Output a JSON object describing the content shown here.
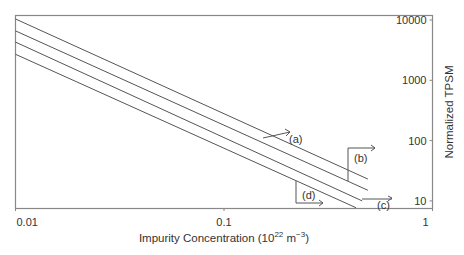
{
  "chart_data": {
    "type": "line",
    "title": "",
    "xlabel": "Impurity Concentration (10^22 m^-3)",
    "xlabel_parts": {
      "base": "Impurity Concentration (10",
      "sup1": "22",
      "mid": " m",
      "sup2": "−3",
      "end": ")"
    },
    "ylabel": "Normalized TPSM",
    "xscale": "log",
    "yscale": "log",
    "xlim": [
      0.01,
      1
    ],
    "ylim": [
      7,
      10000
    ],
    "x_ticks": [
      {
        "value": 0.01,
        "label": "0.01"
      },
      {
        "value": 0.1,
        "label": "0.1"
      },
      {
        "value": 1,
        "label": "1"
      }
    ],
    "y_ticks": [
      {
        "value": 10000,
        "label": "10000"
      },
      {
        "value": 1000,
        "label": "1000"
      },
      {
        "value": 100,
        "label": "100"
      },
      {
        "value": 10,
        "label": "10"
      }
    ],
    "y_axis_position": "right",
    "grid": false,
    "legend": "none (inline annotations)",
    "series": [
      {
        "name": "(a)",
        "x": [
          0.01,
          0.49
        ],
        "values": [
          10400,
          23
        ]
      },
      {
        "name": "(b)",
        "x": [
          0.01,
          0.49
        ],
        "values": [
          6600,
          15
        ]
      },
      {
        "name": "(c)",
        "x": [
          0.01,
          0.46
        ],
        "values": [
          4300,
          10
        ]
      },
      {
        "name": "(d)",
        "x": [
          0.01,
          0.43
        ],
        "values": [
          2700,
          7.7
        ]
      }
    ],
    "annotations": [
      {
        "label": "(a)",
        "points_to": "series (a)"
      },
      {
        "label": "(b)",
        "points_to": "series (b)"
      },
      {
        "label": "(c)",
        "points_to": "series (c)"
      },
      {
        "label": "(d)",
        "points_to": "series (d)"
      }
    ]
  }
}
